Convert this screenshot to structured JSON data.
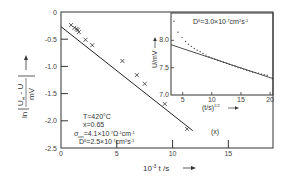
{
  "chart_data": [
    {
      "type": "line",
      "role": "main",
      "title": "",
      "xlabel": "10^-3 t /s",
      "ylabel": "ln |(U∞ - U)/mV|",
      "xlim": [
        0,
        19
      ],
      "ylim": [
        -2.5,
        0
      ],
      "xticks": [
        0,
        5,
        10,
        15
      ],
      "xtick_labels": [
        "0",
        "5",
        "10",
        "15"
      ],
      "yticks": [
        0,
        -0.5,
        -1.0,
        -1.5,
        -2.0,
        -2.5
      ],
      "ytick_labels": [
        "0",
        "-0.5",
        "-1.0",
        "-1.5",
        "-2.0",
        "-2.5"
      ],
      "grid": false,
      "series": [
        {
          "name": "measured",
          "marker": "x",
          "x": [
            0.9,
            1.2,
            1.4,
            1.5,
            1.6,
            2.2,
            2.8,
            5.5,
            6.8,
            7.5,
            9.3,
            11.3
          ],
          "y": [
            -0.24,
            -0.29,
            -0.31,
            -0.33,
            -0.37,
            -0.51,
            -0.61,
            -0.9,
            -1.16,
            -1.32,
            -1.69,
            -2.15
          ]
        },
        {
          "name": "fit",
          "marker": "none",
          "x": [
            0,
            11.8
          ],
          "y": [
            -0.27,
            -2.18
          ]
        }
      ],
      "annotations": [
        "T=420°C",
        "x=0.65",
        "σion=4.1×10⁻⁷Ω⁻¹cm⁻¹",
        "Dδ=2.5×10⁻⁷cm²s⁻¹"
      ]
    },
    {
      "type": "scatter",
      "role": "inset",
      "xlabel": "(t/s)^1/2",
      "ylabel": "U/mV",
      "xlim": [
        3,
        20.5
      ],
      "ylim": [
        7.0,
        8.5
      ],
      "xticks": [
        5,
        10,
        15,
        20
      ],
      "xtick_labels": [
        "5",
        "10",
        "15",
        "20"
      ],
      "yticks": [
        7.0,
        7.5,
        8.0
      ],
      "ytick_labels": [
        "7.0",
        "7.5",
        "8.0"
      ],
      "grid": false,
      "series": [
        {
          "name": "measured",
          "marker": "dot",
          "x": [
            3.5,
            4.2,
            4.9,
            5.5,
            6.0,
            6.5,
            7.0,
            7.5,
            8.0,
            8.5,
            9.0,
            9.5,
            10.0,
            10.5,
            11.0,
            11.5,
            12.0,
            12.5,
            13.0,
            13.5,
            14.0,
            14.5,
            15.0,
            15.5,
            16.0,
            16.5,
            17.0,
            17.5,
            18.0,
            18.5,
            19.0,
            19.5
          ],
          "y": [
            8.35,
            8.15,
            8.05,
            7.98,
            7.93,
            7.89,
            7.85,
            7.82,
            7.79,
            7.76,
            7.73,
            7.7,
            7.68,
            7.66,
            7.64,
            7.62,
            7.6,
            7.58,
            7.56,
            7.54,
            7.52,
            7.5,
            7.49,
            7.47,
            7.45,
            7.44,
            7.42,
            7.41,
            7.4,
            7.38,
            7.37,
            7.36
          ]
        },
        {
          "name": "fit",
          "marker": "none",
          "x": [
            3.0,
            20.5
          ],
          "y": [
            7.92,
            7.3
          ]
        }
      ],
      "annotations": [
        "Dδ=3.0×10⁻⁷cm²s⁻¹",
        "(x)"
      ]
    }
  ],
  "labels": {
    "main_xlabel_text": "10",
    "main_xlabel_exp": "-3",
    "main_xlabel_rest": " t /s",
    "main_y_ln": "ln",
    "main_y_num": "U",
    "main_y_inf": "∞",
    "main_y_num_rest": " - U",
    "main_y_den": "mV",
    "ann_T": "T=420°C",
    "ann_x": "x=0.65",
    "ann_sigma": "σ",
    "ann_sigma_sub": "ion",
    "ann_sigma_rest": "=4.1×10",
    "ann_sigma_exp": "-7",
    "ann_sigma_unit": "Ω",
    "ann_sigma_unit_exp": "-1",
    "ann_sigma_cm": "cm",
    "ann_sigma_cm_exp": "-1",
    "ann_D_main": "D",
    "ann_D_main_sup": "δ",
    "ann_D_main_val": "=2.5×10",
    "ann_D_main_exp": "-7",
    "ann_D_main_unit": "cm",
    "ann_D_main_unit_exp": "2",
    "ann_D_main_s": "s",
    "ann_D_main_s_exp": "-1",
    "ann_D_inset": "D",
    "ann_D_inset_sup": "δ",
    "ann_D_inset_val": "=3.0×10",
    "ann_D_inset_exp": "-7",
    "ann_D_inset_unit": "cm",
    "ann_D_inset_unit_exp": "2",
    "ann_D_inset_s": "s",
    "ann_D_inset_s_exp": "-1",
    "inset_xlabel": "(t/s)",
    "inset_xlabel_exp": "1/2",
    "inset_ylabel": "U/mV",
    "inset_tag": "(x)"
  }
}
